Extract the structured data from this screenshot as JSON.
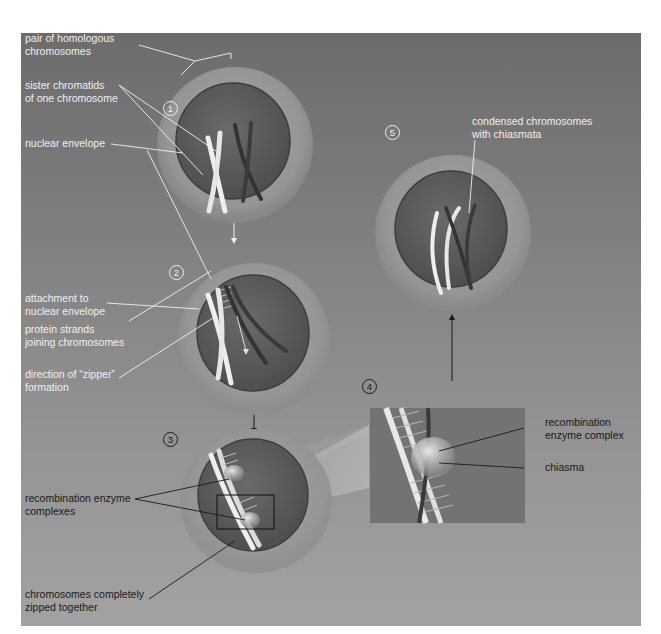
{
  "figure": {
    "colors": {
      "background_top": "#6c6c6c",
      "background_bottom": "#a2a2a2",
      "cell_halo": "#9a9a9a",
      "nucleus": "#5e5e5e",
      "light_chromosome": "#ececec",
      "dark_chromosome": "#3a3a3a",
      "label_light": "#f0f0f0",
      "label_dark": "#1a1a1a"
    }
  },
  "stages": [
    {
      "number": "1",
      "labels": [
        "pair of homologous\nchromosomes",
        "sister chromatids\nof one chromosome",
        "nuclear envelope"
      ]
    },
    {
      "number": "2",
      "labels": [
        "attachment to\nnuclear envelope",
        "protein strands\njoining chromosomes",
        "direction of “zipper”\nformation"
      ]
    },
    {
      "number": "3",
      "labels": [
        "recombination enzyme\ncomplexes",
        "chromosomes completely\nzipped together"
      ]
    },
    {
      "number": "4",
      "labels": [
        "recombination\nenzyme complex",
        "chiasma"
      ]
    },
    {
      "number": "5",
      "labels": [
        "condensed chromosomes\nwith chiasmata"
      ]
    }
  ]
}
